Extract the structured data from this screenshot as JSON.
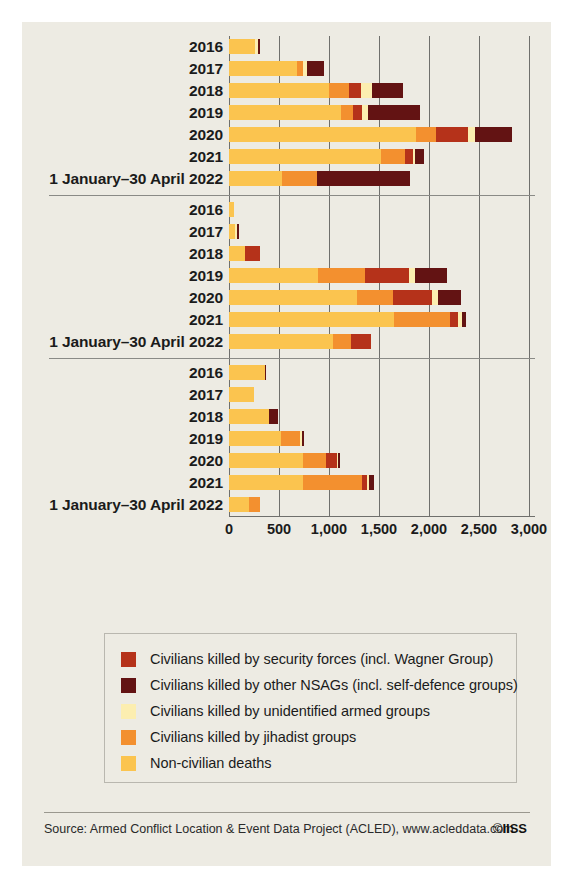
{
  "source": {
    "text": "Source: Armed Conflict Location & Event Data Project (ACLED), www.acleddata.com",
    "credit_symbol": "©",
    "credit": "IISS"
  },
  "legend": {
    "items": [
      {
        "label": "Civilians killed by security forces (incl. Wagner Group)",
        "color": "#b5321a",
        "key": "security_forces"
      },
      {
        "label": "Civilians killed by other NSAGs (incl. self-defence groups)",
        "color": "#631313",
        "key": "other_nsags"
      },
      {
        "label": "Civilians killed by unidentified armed groups",
        "color": "#fceeb0",
        "key": "unidentified"
      },
      {
        "label": "Civilians killed by jihadist groups",
        "color": "#f3902f",
        "key": "jihadist"
      },
      {
        "label": "Non-civilian deaths",
        "color": "#fbc44f",
        "key": "non_civilian"
      }
    ]
  },
  "chart_data": {
    "type": "bar",
    "orientation": "horizontal",
    "stacked": true,
    "title": "",
    "xlabel": "",
    "ylabel": "",
    "xlim": [
      0,
      3000
    ],
    "xticks": [
      0,
      500,
      1000,
      1500,
      2000,
      2500,
      3000
    ],
    "xtick_labels": [
      "0",
      "500",
      "1,000",
      "1,500",
      "2,000",
      "2,500",
      "3,000"
    ],
    "grid": true,
    "legend_position": "bottom",
    "series": [
      {
        "name": "Non-civilian deaths",
        "key": "non_civilian",
        "color": "#fbc44f"
      },
      {
        "name": "Civilians killed by jihadist groups",
        "key": "jihadist",
        "color": "#f3902f"
      },
      {
        "name": "Civilians killed by security forces (incl. Wagner Group)",
        "key": "security_forces",
        "color": "#b5321a"
      },
      {
        "name": "Civilians killed by unidentified armed groups",
        "key": "unidentified",
        "color": "#fceeb0"
      },
      {
        "name": "Civilians killed by other NSAGs (incl. self-defence groups)",
        "key": "other_nsags",
        "color": "#631313"
      }
    ],
    "groups": [
      {
        "name": "Mali",
        "rows": [
          {
            "label": "2016",
            "values": {
              "non_civilian": 260,
              "jihadist": 0,
              "security_forces": 0,
              "unidentified": 25,
              "other_nsags": 20
            },
            "total": 305
          },
          {
            "label": "2017",
            "values": {
              "non_civilian": 680,
              "jihadist": 60,
              "security_forces": 0,
              "unidentified": 35,
              "other_nsags": 170
            },
            "total": 945
          },
          {
            "label": "2018",
            "values": {
              "non_civilian": 1000,
              "jihadist": 200,
              "security_forces": 115,
              "unidentified": 115,
              "other_nsags": 305
            },
            "total": 1735
          },
          {
            "label": "2019",
            "values": {
              "non_civilian": 1115,
              "jihadist": 125,
              "security_forces": 85,
              "unidentified": 60,
              "other_nsags": 520
            },
            "total": 1905
          },
          {
            "label": "2020",
            "values": {
              "non_civilian": 1870,
              "jihadist": 200,
              "security_forces": 320,
              "unidentified": 65,
              "other_nsags": 370
            },
            "total": 2825
          },
          {
            "label": "2021",
            "values": {
              "non_civilian": 1520,
              "jihadist": 235,
              "security_forces": 80,
              "unidentified": 25,
              "other_nsags": 90
            },
            "total": 1950
          },
          {
            "label": "1 January–30 April 2022",
            "values": {
              "non_civilian": 525,
              "jihadist": 350,
              "security_forces": 0,
              "unidentified": 0,
              "other_nsags": 935
            },
            "total": 1810
          }
        ]
      },
      {
        "name": "Burkina Faso",
        "rows": [
          {
            "label": "2016",
            "values": {
              "non_civilian": 50,
              "jihadist": 0,
              "security_forces": 0,
              "unidentified": 0,
              "other_nsags": 0
            },
            "total": 50
          },
          {
            "label": "2017",
            "values": {
              "non_civilian": 55,
              "jihadist": 0,
              "security_forces": 0,
              "unidentified": 20,
              "other_nsags": 20
            },
            "total": 95
          },
          {
            "label": "2018",
            "values": {
              "non_civilian": 160,
              "jihadist": 0,
              "security_forces": 150,
              "unidentified": 0,
              "other_nsags": 0
            },
            "total": 310
          },
          {
            "label": "2019",
            "values": {
              "non_civilian": 890,
              "jihadist": 470,
              "security_forces": 440,
              "unidentified": 60,
              "other_nsags": 320
            },
            "total": 2180
          },
          {
            "label": "2020",
            "values": {
              "non_civilian": 1275,
              "jihadist": 365,
              "security_forces": 390,
              "unidentified": 60,
              "other_nsags": 230
            },
            "total": 2320
          },
          {
            "label": "2021",
            "values": {
              "non_civilian": 1645,
              "jihadist": 560,
              "security_forces": 80,
              "unidentified": 40,
              "other_nsags": 40
            },
            "total": 2365
          },
          {
            "label": "1 January–30 April 2022",
            "values": {
              "non_civilian": 1040,
              "jihadist": 175,
              "security_forces": 200,
              "unidentified": 0,
              "other_nsags": 0
            },
            "total": 1415
          }
        ]
      },
      {
        "name": "Niger",
        "rows": [
          {
            "label": "2016",
            "values": {
              "non_civilian": 355,
              "jihadist": 0,
              "security_forces": 0,
              "unidentified": 0,
              "other_nsags": 15
            },
            "total": 370
          },
          {
            "label": "2017",
            "values": {
              "non_civilian": 245,
              "jihadist": 0,
              "security_forces": 0,
              "unidentified": 0,
              "other_nsags": 0
            },
            "total": 245
          },
          {
            "label": "2018",
            "values": {
              "non_civilian": 395,
              "jihadist": 0,
              "security_forces": 0,
              "unidentified": 0,
              "other_nsags": 95
            },
            "total": 490
          },
          {
            "label": "2019",
            "values": {
              "non_civilian": 520,
              "jihadist": 185,
              "security_forces": 0,
              "unidentified": 25,
              "other_nsags": 15
            },
            "total": 745
          },
          {
            "label": "2020",
            "values": {
              "non_civilian": 740,
              "jihadist": 230,
              "security_forces": 105,
              "unidentified": 15,
              "other_nsags": 15
            },
            "total": 1105
          },
          {
            "label": "2021",
            "values": {
              "non_civilian": 735,
              "jihadist": 590,
              "security_forces": 55,
              "unidentified": 20,
              "other_nsags": 45
            },
            "total": 1445
          },
          {
            "label": "1 January–30 April 2022",
            "values": {
              "non_civilian": 200,
              "jihadist": 110,
              "security_forces": 0,
              "unidentified": 0,
              "other_nsags": 0
            },
            "total": 310
          }
        ]
      }
    ]
  }
}
